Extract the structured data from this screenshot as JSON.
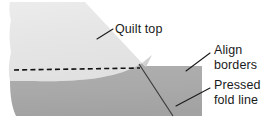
{
  "diagram": {
    "title": "Quilt border alignment diagram",
    "canvas": {
      "width": 271,
      "height": 127,
      "background": "#ffffff"
    },
    "colors": {
      "quilt_top_fill": "#e6e6e6",
      "border_fill": "#a9a9a9",
      "border_fill_shade": "#b3b3b3",
      "line_dark": "#1a1a1a",
      "fold_line": "#3d3d3d"
    },
    "shapes": [
      {
        "name": "quilt-top-piece",
        "description": "light gray quilt top fabric with angled upper-right corner",
        "fill": "#e6e6e6"
      },
      {
        "name": "border-piece",
        "description": "medium gray pressed border strip along the bottom",
        "fill": "#a9a9a9"
      },
      {
        "name": "folded-corner-tip",
        "description": "small triangular folded tip rising above the border edge",
        "fill": "#d0d0d0"
      }
    ],
    "lines": {
      "pressed_fold": {
        "name": "pressed-fold-line",
        "style": "solid",
        "color": "#3d3d3d"
      },
      "stitch_guide": {
        "name": "stitching-dashed-line",
        "style": "dashed",
        "color": "#111111"
      }
    },
    "labels": [
      {
        "id": "quilt-top",
        "lines": [
          "Quilt top"
        ],
        "x": 115,
        "y": 33,
        "anchor": "start",
        "leader": {
          "x1": 97,
          "y1": 39,
          "x2": 113,
          "y2": 29
        }
      },
      {
        "id": "align-borders",
        "lines": [
          "Align",
          "borders"
        ],
        "x": 214,
        "y": 54,
        "anchor": "start",
        "leader": {
          "x1": 186,
          "y1": 71,
          "x2": 210,
          "y2": 53
        }
      },
      {
        "id": "pressed-fold-line",
        "lines": [
          "Pressed",
          "fold line"
        ],
        "x": 214,
        "y": 89,
        "anchor": "start",
        "leader": {
          "x1": 176,
          "y1": 106,
          "x2": 210,
          "y2": 88
        }
      }
    ]
  }
}
